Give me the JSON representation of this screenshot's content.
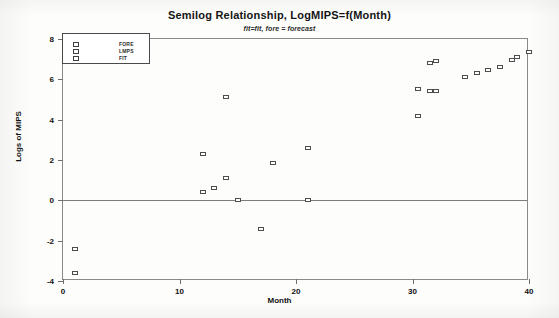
{
  "chart_data": {
    "type": "scatter",
    "title": "Semilog Relationship, LogMIPS=f(Month)",
    "subtitle": "fit=fit, fore = forecast",
    "xlabel": "Month",
    "ylabel": "Logs of MIPS",
    "xlim": [
      0,
      40
    ],
    "ylim": [
      -4,
      8
    ],
    "xticks": [
      0,
      10,
      20,
      30,
      40
    ],
    "yticks": [
      8,
      6,
      4,
      2,
      0,
      -2,
      -4
    ],
    "grid": false,
    "zero_line": true,
    "legend_position": "top-left",
    "marker": "open-square",
    "legend": [
      {
        "label": "FORE",
        "marker": "open-square"
      },
      {
        "label": "LMPS",
        "marker": "open-square"
      },
      {
        "label": "FIT",
        "marker": "open-square"
      }
    ],
    "points": [
      {
        "x": 1.0,
        "y": -2.4
      },
      {
        "x": 1.0,
        "y": -3.6
      },
      {
        "x": 12.0,
        "y": 2.3
      },
      {
        "x": 12.0,
        "y": 0.4
      },
      {
        "x": 13.0,
        "y": 0.6
      },
      {
        "x": 14.0,
        "y": 5.1
      },
      {
        "x": 14.0,
        "y": 1.1
      },
      {
        "x": 15.0,
        "y": 0.0
      },
      {
        "x": 17.0,
        "y": -1.4
      },
      {
        "x": 18.0,
        "y": 1.85
      },
      {
        "x": 21.0,
        "y": 2.6
      },
      {
        "x": 21.0,
        "y": 0.0
      },
      {
        "x": 30.5,
        "y": 4.2
      },
      {
        "x": 30.5,
        "y": 5.5
      },
      {
        "x": 31.5,
        "y": 5.4
      },
      {
        "x": 31.5,
        "y": 6.8
      },
      {
        "x": 32.0,
        "y": 5.4
      },
      {
        "x": 32.0,
        "y": 6.9
      },
      {
        "x": 34.5,
        "y": 6.1
      },
      {
        "x": 35.5,
        "y": 6.3
      },
      {
        "x": 36.5,
        "y": 6.45
      },
      {
        "x": 37.5,
        "y": 6.6
      },
      {
        "x": 38.5,
        "y": 6.95
      },
      {
        "x": 39.0,
        "y": 7.1
      },
      {
        "x": 40.0,
        "y": 7.35
      }
    ]
  }
}
